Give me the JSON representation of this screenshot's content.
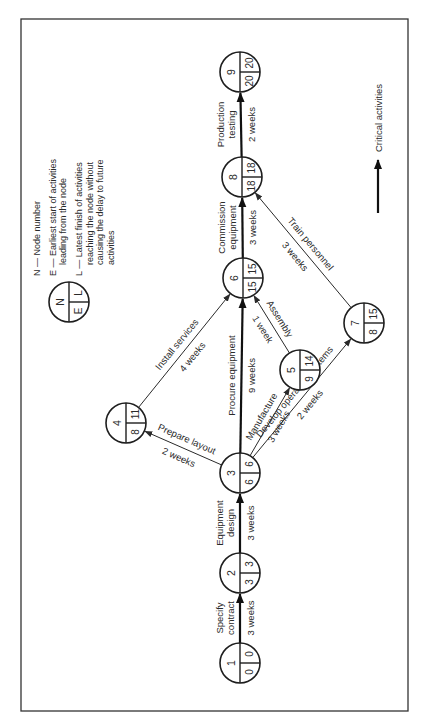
{
  "figure": {
    "frame": {
      "x": 21,
      "y": 19,
      "width": 387,
      "height": 692
    },
    "rotation_deg": -90,
    "colors": {
      "ink": "#2a2a2a",
      "critical": "#111111",
      "background": "#ffffff"
    }
  },
  "legend": {
    "symbol": {
      "cx": 69,
      "cy": 302,
      "r": 20,
      "n": "N",
      "e": "E",
      "l": "L"
    },
    "entries": [
      {
        "key": "N",
        "lines": [
          "N — Node number"
        ]
      },
      {
        "key": "E",
        "lines": [
          "E — Earliest start of activities",
          "leading from the node"
        ]
      },
      {
        "key": "L",
        "lines": [
          "L — Latest finish of activities",
          "reaching the node without",
          "causing the delay to future",
          "activities"
        ]
      }
    ],
    "critical": {
      "label": "Critical activities",
      "x": 378,
      "y1": 213,
      "y2": 160
    }
  },
  "nodes": [
    {
      "id": 1,
      "cx": 240,
      "cy": 663,
      "e": "0",
      "l": "0"
    },
    {
      "id": 2,
      "cx": 240,
      "cy": 573,
      "e": "3",
      "l": "3"
    },
    {
      "id": 3,
      "cx": 240,
      "cy": 473,
      "e": "6",
      "l": "6"
    },
    {
      "id": 4,
      "cx": 126,
      "cy": 423,
      "e": "8",
      "l": "11"
    },
    {
      "id": 5,
      "cx": 300,
      "cy": 370,
      "e": "9",
      "l": "14"
    },
    {
      "id": 6,
      "cx": 243,
      "cy": 278,
      "e": "15",
      "l": "15"
    },
    {
      "id": 7,
      "cx": 364,
      "cy": 323,
      "e": "8",
      "l": "15"
    },
    {
      "id": 8,
      "cx": 242,
      "cy": 177,
      "e": "18",
      "l": "18"
    },
    {
      "id": 9,
      "cx": 240,
      "cy": 72,
      "e": "20",
      "l": "20"
    }
  ],
  "activities": [
    {
      "from": 1,
      "to": 2,
      "name": [
        "Specify",
        "contract"
      ],
      "duration": "3 weeks",
      "critical": true
    },
    {
      "from": 2,
      "to": 3,
      "name": [
        "Equipment",
        "design"
      ],
      "duration": "3 weeks",
      "critical": true
    },
    {
      "from": 3,
      "to": 4,
      "name": [
        "Prepare layout"
      ],
      "duration": "2 weeks",
      "critical": false
    },
    {
      "from": 4,
      "to": 6,
      "name": [
        "Install services"
      ],
      "duration": "4 weeks",
      "critical": false
    },
    {
      "from": 3,
      "to": 6,
      "name": [
        "Procure equipment"
      ],
      "duration": "9 weeks",
      "critical": true
    },
    {
      "from": 3,
      "to": 5,
      "name": [
        "Manufacture"
      ],
      "duration": "3 weeks",
      "critical": false
    },
    {
      "from": 5,
      "to": 6,
      "name": [
        "Assembly"
      ],
      "duration": "1 week",
      "critical": false
    },
    {
      "from": 3,
      "to": 7,
      "name": [
        "Develop operating systems"
      ],
      "duration": "2 weeks",
      "critical": false
    },
    {
      "from": 6,
      "to": 8,
      "name": [
        "Commission",
        "equipment"
      ],
      "duration": "3 weeks",
      "critical": true
    },
    {
      "from": 7,
      "to": 8,
      "name": [
        "Train personnel"
      ],
      "duration": "3 weeks",
      "critical": false
    },
    {
      "from": 8,
      "to": 9,
      "name": [
        "Production",
        "testing"
      ],
      "duration": "2 weeks",
      "critical": true
    }
  ]
}
